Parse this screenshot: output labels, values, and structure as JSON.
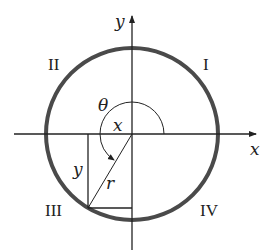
{
  "diagram": {
    "type": "unit-circle-quadrant-angle",
    "axes": {
      "x_label": "x",
      "y_label": "y"
    },
    "quadrants": {
      "q1": "I",
      "q2": "II",
      "q3": "III",
      "q4": "IV"
    },
    "angle_label": "θ",
    "segment_labels": {
      "horizontal_leg": "x",
      "vertical_leg": "y",
      "radius": "r"
    },
    "colors": {
      "circle": "#4a4a4a",
      "lines": "#222222",
      "background": "#ffffff"
    }
  }
}
